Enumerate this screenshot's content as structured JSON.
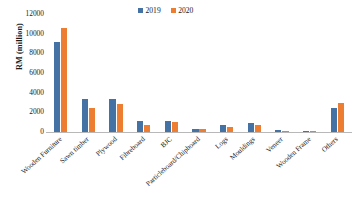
{
  "chart_data": {
    "type": "bar",
    "title": "",
    "subtitle": "",
    "xlabel": "",
    "ylabel": "RM (million)",
    "ylim": [
      0,
      12000
    ],
    "ytick_labels": [
      "12000",
      "10000",
      "8000",
      "6000",
      "4000",
      "2000",
      "0"
    ],
    "ytick_values": [
      12000,
      10000,
      8000,
      6000,
      4000,
      2000,
      0
    ],
    "grid": false,
    "legend_position": "top-center",
    "categories": [
      "Wooden Furniture",
      "Sawn timber",
      "Plywood",
      "Fibreboard",
      "BJC",
      "Particleboard/Chipboard",
      "Logs",
      "Mouldings",
      "Veneer",
      "Wooden Frame",
      "Others"
    ],
    "series": [
      {
        "name": "2019",
        "color": "#4472A4",
        "values": [
          9150,
          3400,
          3400,
          1100,
          1080,
          350,
          750,
          900,
          200,
          40,
          2400
        ]
      },
      {
        "name": "2020",
        "color": "#ED7D31",
        "values": [
          10600,
          2450,
          2850,
          750,
          1000,
          280,
          560,
          700,
          100,
          30,
          2950
        ]
      }
    ]
  },
  "legend": {
    "items": [
      {
        "label": "2019",
        "color": "#4472A4"
      },
      {
        "label": "2020",
        "color": "#ED7D31"
      }
    ]
  },
  "axes": {
    "y_title": "RM (million)"
  }
}
